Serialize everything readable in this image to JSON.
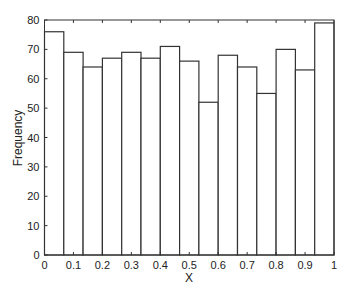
{
  "chart_data": {
    "type": "bar",
    "subtype": "histogram",
    "title": "",
    "xlabel": "X",
    "ylabel": "Frequency",
    "xlim": [
      0,
      1
    ],
    "ylim": [
      0,
      80
    ],
    "grid": false,
    "legend": null,
    "bin_edges": [
      0,
      0.0667,
      0.1333,
      0.2,
      0.2667,
      0.3333,
      0.4,
      0.4667,
      0.5333,
      0.6,
      0.6667,
      0.7333,
      0.8,
      0.8667,
      0.9333,
      1.0
    ],
    "values": [
      76,
      69,
      64,
      67,
      69,
      67,
      71,
      66,
      52,
      68,
      64,
      55,
      70,
      63,
      79
    ],
    "xticks": [
      0,
      0.1,
      0.2,
      0.3,
      0.4,
      0.5,
      0.6,
      0.7,
      0.8,
      0.9,
      1
    ],
    "xtick_labels": [
      "0",
      "0.1",
      "0.2",
      "0.3",
      "0.4",
      "0.5",
      "0.6",
      "0.7",
      "0.8",
      "0.9",
      "1"
    ],
    "yticks": [
      0,
      10,
      20,
      30,
      40,
      50,
      60,
      70,
      80
    ],
    "ytick_labels": [
      "0",
      "10",
      "20",
      "30",
      "40",
      "50",
      "60",
      "70",
      "80"
    ],
    "colors": {
      "bar_fill": "#ffffff",
      "bar_edge": "#333333",
      "axis": "#333333"
    }
  }
}
